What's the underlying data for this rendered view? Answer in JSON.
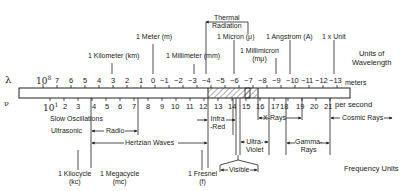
{
  "wavelength": {
    "symbol": "λ",
    "unit_label": "meters",
    "units_title_line1": "Units of",
    "units_title_line2": "Wavelength",
    "first_base": "10",
    "first_exp": "8",
    "ticks": [
      "7",
      "6",
      "5",
      "4",
      "3",
      "2",
      "1",
      "0",
      "−1",
      "−2",
      "−3",
      "−4",
      "−5",
      "−6",
      "−7",
      "−8",
      "−9",
      "−10",
      "−11",
      "−12",
      "−13"
    ],
    "units": [
      {
        "name": "1 Kilometer (km)",
        "exp": "3"
      },
      {
        "name": "1 Meter (m)",
        "exp": "0"
      },
      {
        "name": "1 Millimeter (mm)",
        "exp": "−3"
      },
      {
        "name": "1 Micron (μ)",
        "exp": "−6"
      },
      {
        "name_line1": "1 Millimicron",
        "name_line2": "(mμ)",
        "exp": "−9"
      },
      {
        "name": "1 Angstrom (A)",
        "exp": "−10"
      },
      {
        "name": "1 x Unit",
        "exp": "−13"
      }
    ],
    "thermal_line1": "Thermal",
    "thermal_line2": "Radiation"
  },
  "frequency": {
    "symbol": "ν",
    "unit_label": "per second",
    "units_title": "Frequency Units",
    "first_base": "10",
    "first_exp": "1",
    "ticks": [
      "2",
      "3",
      "4",
      "5",
      "6",
      "7",
      "8",
      "9",
      "10",
      "11",
      "12",
      "13",
      "14",
      "15",
      "16",
      "17",
      "18",
      "19",
      "20",
      "21"
    ],
    "units": [
      {
        "line1": "1 Kilocycle",
        "line2": "(kc)"
      },
      {
        "line1": "1 Megacycle",
        "line2": "(mc)"
      },
      {
        "line1": "1 Fresnel",
        "line2": "(f)"
      }
    ]
  },
  "bands": {
    "slow": "Slow Oscillations",
    "ultrasonic": "Ultrasonic",
    "radio": "Radio",
    "hertzian": "Hertzian Waves",
    "infrared_line1": "Infra",
    "infrared_line2": "-Red",
    "visible": "Visible",
    "ultraviolet_line1": "Ultra-",
    "ultraviolet_line2": "Violet",
    "xrays": "X-Rays",
    "gamma_line1": "Gamma-",
    "gamma_line2": "Rays",
    "cosmic": "Cosmic Rays"
  }
}
